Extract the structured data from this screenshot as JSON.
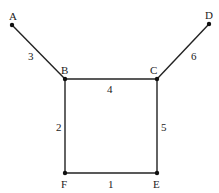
{
  "graph": {
    "nodes": [
      {
        "id": "A",
        "label": "A",
        "x": 12,
        "y": 25,
        "lx": 9,
        "ly": 20
      },
      {
        "id": "B",
        "label": "B",
        "x": 65,
        "y": 79,
        "lx": 61,
        "ly": 74
      },
      {
        "id": "C",
        "label": "C",
        "x": 157,
        "y": 79,
        "lx": 150,
        "ly": 74
      },
      {
        "id": "D",
        "label": "D",
        "x": 209,
        "y": 24,
        "lx": 205,
        "ly": 19
      },
      {
        "id": "E",
        "label": "E",
        "x": 157,
        "y": 173,
        "lx": 153,
        "ly": 188
      },
      {
        "id": "F",
        "label": "F",
        "x": 65,
        "y": 173,
        "lx": 61,
        "ly": 188
      }
    ],
    "edges": [
      {
        "from": "A",
        "to": "B",
        "weight": "3",
        "lx": 28,
        "ly": 60
      },
      {
        "from": "B",
        "to": "C",
        "weight": "4",
        "lx": 107,
        "ly": 93
      },
      {
        "from": "C",
        "to": "D",
        "weight": "6",
        "lx": 191,
        "ly": 60
      },
      {
        "from": "B",
        "to": "F",
        "weight": "2",
        "lx": 56,
        "ly": 131
      },
      {
        "from": "C",
        "to": "E",
        "weight": "5",
        "lx": 161,
        "ly": 131
      },
      {
        "from": "F",
        "to": "E",
        "weight": "1",
        "lx": 108,
        "ly": 188
      }
    ]
  }
}
